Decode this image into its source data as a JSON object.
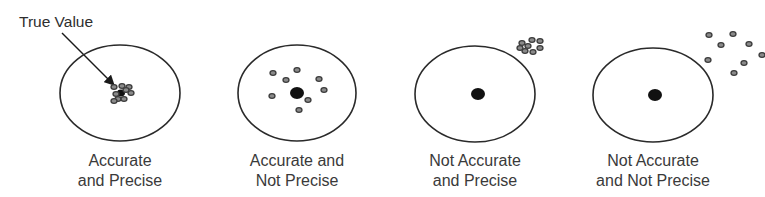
{
  "annotation": {
    "label": "True Value",
    "arrow": {
      "from": [
        62,
        33
      ],
      "to": [
        114,
        85
      ]
    }
  },
  "colors": {
    "ring": "#2a2a2a",
    "bullseye": "#111111",
    "shot_fill": "#8a8a8a",
    "shot_stroke": "#3c3c3c",
    "text": "#3a3a3a"
  },
  "targets": [
    {
      "id": "accurate-precise",
      "center": [
        120,
        93
      ],
      "radius": [
        60,
        48
      ],
      "bullseye": {
        "center": [
          121,
          93
        ],
        "r": 4
      },
      "label_lines": [
        "Accurate",
        "and Precise"
      ],
      "shots": [
        [
          114,
          87
        ],
        [
          122,
          86
        ],
        [
          129,
          87
        ],
        [
          116,
          94
        ],
        [
          131,
          93
        ],
        [
          118,
          99
        ],
        [
          124,
          99
        ],
        [
          126,
          90
        ],
        [
          114,
          101
        ]
      ]
    },
    {
      "id": "accurate-not-precise",
      "center": [
        297,
        93
      ],
      "radius": [
        59,
        48
      ],
      "bullseye": {
        "center": [
          297,
          93
        ],
        "r": 7
      },
      "label_lines": [
        "Accurate and",
        "Not Precise"
      ],
      "shots": [
        [
          273,
          73
        ],
        [
          297,
          70
        ],
        [
          286,
          80
        ],
        [
          319,
          79
        ],
        [
          272,
          96
        ],
        [
          324,
          90
        ],
        [
          308,
          100
        ],
        [
          299,
          110
        ]
      ]
    },
    {
      "id": "not-accurate-precise",
      "center": [
        475,
        94
      ],
      "radius": [
        60,
        48
      ],
      "bullseye": {
        "center": [
          478,
          94
        ],
        "r": 7
      },
      "label_lines": [
        "Not Accurate",
        "and Precise"
      ],
      "shots": [
        [
          522,
          43
        ],
        [
          532,
          40
        ],
        [
          540,
          41
        ],
        [
          528,
          46
        ],
        [
          540,
          48
        ],
        [
          525,
          51
        ],
        [
          533,
          52
        ],
        [
          520,
          48
        ]
      ]
    },
    {
      "id": "not-accurate-not-precise",
      "center": [
        653,
        95
      ],
      "radius": [
        60,
        47
      ],
      "bullseye": {
        "center": [
          655,
          95
        ],
        "r": 7
      },
      "label_lines": [
        "Not Accurate",
        "and Not Precise"
      ],
      "shots": [
        [
          709,
          35
        ],
        [
          733,
          34
        ],
        [
          721,
          45
        ],
        [
          749,
          44
        ],
        [
          708,
          60
        ],
        [
          762,
          55
        ],
        [
          744,
          63
        ],
        [
          734,
          73
        ]
      ]
    }
  ]
}
